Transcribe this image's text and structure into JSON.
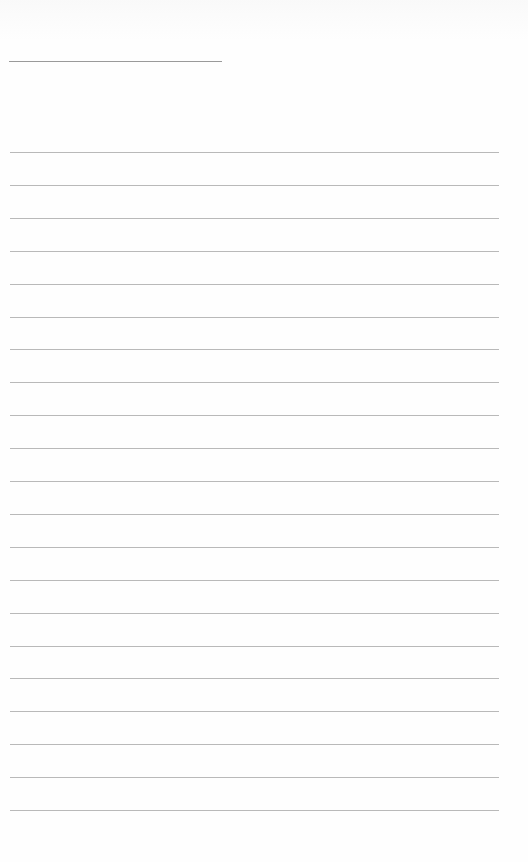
{
  "page": {
    "type": "lined-paper",
    "background": "#fefefe",
    "line_color": "#b9b9b9",
    "title_line_color": "#9a9a9a"
  },
  "title_line": {
    "x": 9,
    "y": 61,
    "width": 213
  },
  "rules": {
    "count": 21,
    "first_y": 152,
    "spacing": 32.9,
    "x": 10,
    "width": 489
  }
}
